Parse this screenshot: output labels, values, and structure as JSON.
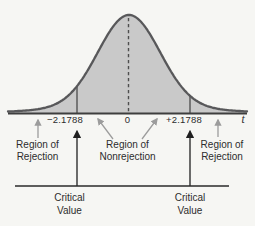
{
  "figure_type": "t-distribution hypothesis test regions",
  "colors": {
    "background": "#f6f6f3",
    "curve_fill": "#c9c9c9",
    "curve_stroke": "#58585a",
    "axis": "#3e3e3e",
    "text": "#2d2d2d",
    "gray_arrow": "#9c9c9c",
    "black_arrow": "#1f1f1f"
  },
  "axis": {
    "t_label": "t"
  },
  "ticks": {
    "left": "−2.1788",
    "center": "0",
    "right": "+2.1788"
  },
  "regions": {
    "rejection_left": {
      "line1": "Region of",
      "line2": "Rejection"
    },
    "nonrejection": {
      "line1": "Region of",
      "line2": "Nonrejection"
    },
    "rejection_right": {
      "line1": "Region of",
      "line2": "Rejection"
    }
  },
  "critical": {
    "left": {
      "line1": "Critical",
      "line2": "Value"
    },
    "right": {
      "line1": "Critical",
      "line2": "Value"
    }
  }
}
